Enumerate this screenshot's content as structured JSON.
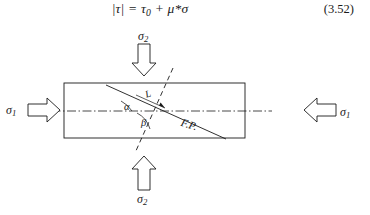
{
  "equation": {
    "lhs": "|τ|",
    "equals": "=",
    "tau_zero_base": "τ",
    "tau_zero_sub": "0",
    "plus": "+",
    "rhs_term": "μ*σ",
    "full_text": "|τ| = τ0 + μ*σ",
    "number": "(3.52)"
  },
  "figure": {
    "stress_top": {
      "base": "σ",
      "sub": "2",
      "full": "σ2",
      "arrow": "down-arrow-icon"
    },
    "stress_bottom": {
      "base": "σ",
      "sub": "2",
      "full": "σ2",
      "arrow": "up-arrow-icon"
    },
    "stress_left": {
      "base": "σ",
      "sub": "1",
      "full": "σ1",
      "arrow": "right-arrow-icon"
    },
    "stress_right": {
      "base": "σ",
      "sub": "1",
      "full": "σ1",
      "arrow": "left-arrow-icon"
    },
    "angle_alpha": "α",
    "angle_beta": "β",
    "fault_plane_label": "F.P.",
    "length_label": "L",
    "colors": {
      "ink": "#1a1a1a",
      "background": "#ffffff"
    }
  }
}
